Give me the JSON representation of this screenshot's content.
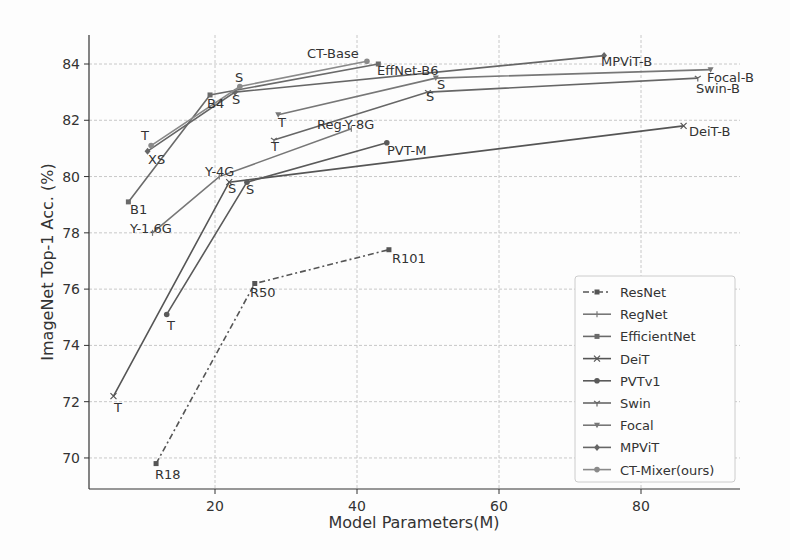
{
  "chart_data": {
    "type": "line",
    "title": "",
    "xlabel": "Model Parameters(M)",
    "ylabel": "ImageNet Top-1 Acc. (%)",
    "xlim": [
      2,
      93
    ],
    "ylim": [
      68.9,
      85.1
    ],
    "xticks": [
      20,
      40,
      60,
      80
    ],
    "yticks": [
      70,
      72,
      74,
      76,
      78,
      80,
      82,
      84
    ],
    "grid": true,
    "legend_position": "lower right",
    "series": [
      {
        "name": "ResNet",
        "marker": "square",
        "dash": "6,3,2,3",
        "color": "#555555",
        "points": [
          {
            "x": 11.7,
            "y": 69.8,
            "label": "R18"
          },
          {
            "x": 25.6,
            "y": 76.2,
            "label": "R50"
          },
          {
            "x": 44.5,
            "y": 77.4,
            "label": "R101"
          }
        ]
      },
      {
        "name": "RegNet",
        "marker": "vline",
        "dash": "",
        "color": "#777777",
        "points": [
          {
            "x": 11.2,
            "y": 78.0,
            "label": "Y-1.6G"
          },
          {
            "x": 20.6,
            "y": 80.0,
            "label": "Y-4G"
          },
          {
            "x": 39.2,
            "y": 81.7,
            "label": "Reg-Y-8G"
          }
        ]
      },
      {
        "name": "EfficientNet",
        "marker": "square",
        "dash": "",
        "color": "#6a6a6a",
        "points": [
          {
            "x": 7.8,
            "y": 79.1,
            "label": "B1"
          },
          {
            "x": 19.3,
            "y": 82.9,
            "label": "B4"
          },
          {
            "x": 43.0,
            "y": 84.0,
            "label": "EffNet-B6"
          }
        ]
      },
      {
        "name": "DeiT",
        "marker": "x",
        "dash": "",
        "color": "#555555",
        "points": [
          {
            "x": 5.7,
            "y": 72.2,
            "label": "T"
          },
          {
            "x": 22.0,
            "y": 79.8,
            "label": "S"
          },
          {
            "x": 86.0,
            "y": 81.8,
            "label": "DeiT-B"
          }
        ]
      },
      {
        "name": "PVTv1",
        "marker": "circle",
        "dash": "",
        "color": "#5a5a5a",
        "points": [
          {
            "x": 13.2,
            "y": 75.1,
            "label": "T"
          },
          {
            "x": 24.5,
            "y": 79.8,
            "label": "S"
          },
          {
            "x": 44.2,
            "y": 81.2,
            "label": "PVT-M"
          }
        ]
      },
      {
        "name": "Swin",
        "marker": "tri_down",
        "dash": "",
        "color": "#666666",
        "points": [
          {
            "x": 28.3,
            "y": 81.3,
            "label": "T"
          },
          {
            "x": 50.0,
            "y": 83.0,
            "label": "S"
          },
          {
            "x": 88.0,
            "y": 83.5,
            "label": "Swin-B"
          }
        ]
      },
      {
        "name": "Focal",
        "marker": "triangle_down",
        "dash": "",
        "color": "#777777",
        "points": [
          {
            "x": 28.9,
            "y": 82.2,
            "label": "T"
          },
          {
            "x": 51.1,
            "y": 83.5,
            "label": "S"
          },
          {
            "x": 89.8,
            "y": 83.8,
            "label": "Focal-B"
          }
        ]
      },
      {
        "name": "MPViT",
        "marker": "diamond",
        "dash": "",
        "color": "#666666",
        "points": [
          {
            "x": 10.5,
            "y": 80.9,
            "label": "XS"
          },
          {
            "x": 22.8,
            "y": 83.0,
            "label": "S"
          },
          {
            "x": 74.8,
            "y": 84.3,
            "label": "MPViT-B"
          }
        ]
      },
      {
        "name": "CT-Mixer(ours)",
        "marker": "circle",
        "dash": "",
        "color": "#8a8a8a",
        "points": [
          {
            "x": 11.0,
            "y": 81.1,
            "label": "T"
          },
          {
            "x": 23.5,
            "y": 83.2,
            "label": "S"
          },
          {
            "x": 41.4,
            "y": 84.1,
            "label": "CT-Base"
          }
        ]
      }
    ]
  },
  "labels": [
    {
      "text": "CT-Base",
      "x": 307,
      "y": 58
    },
    {
      "text": "EffNet-B6",
      "x": 377,
      "y": 75
    },
    {
      "text": "MPViT-B",
      "x": 601,
      "y": 66
    },
    {
      "text": "Focal-B",
      "x": 707,
      "y": 82
    },
    {
      "text": "Swin-B",
      "x": 696,
      "y": 93
    },
    {
      "text": "S",
      "x": 235,
      "y": 82
    },
    {
      "text": "S",
      "x": 232,
      "y": 104
    },
    {
      "text": "B4",
      "x": 207,
      "y": 108
    },
    {
      "text": "S",
      "x": 437,
      "y": 89
    },
    {
      "text": "S",
      "x": 426,
      "y": 101
    },
    {
      "text": "T",
      "x": 141,
      "y": 140
    },
    {
      "text": "XS",
      "x": 148,
      "y": 164
    },
    {
      "text": "T",
      "x": 278,
      "y": 127
    },
    {
      "text": "Reg-Y-8G",
      "x": 317,
      "y": 129
    },
    {
      "text": "T",
      "x": 271,
      "y": 151
    },
    {
      "text": "PVT-M",
      "x": 387,
      "y": 155
    },
    {
      "text": "DeiT-B",
      "x": 689,
      "y": 136
    },
    {
      "text": "Y-4G",
      "x": 205,
      "y": 176
    },
    {
      "text": "S",
      "x": 228,
      "y": 193
    },
    {
      "text": "S",
      "x": 246,
      "y": 194
    },
    {
      "text": "B1",
      "x": 130,
      "y": 214
    },
    {
      "text": "Y-1.6G",
      "x": 130,
      "y": 233
    },
    {
      "text": "R101",
      "x": 392,
      "y": 263
    },
    {
      "text": "R50",
      "x": 250,
      "y": 297
    },
    {
      "text": "T",
      "x": 167,
      "y": 330
    },
    {
      "text": "T",
      "x": 114,
      "y": 412
    },
    {
      "text": "R18",
      "x": 155,
      "y": 479
    }
  ]
}
